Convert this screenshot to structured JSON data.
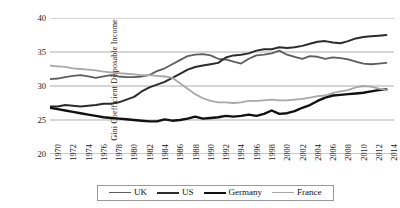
{
  "chart_data": {
    "type": "line",
    "title": "",
    "xlabel": "",
    "ylabel": "Gini Coefficient Disposable Income",
    "xlim": [
      1970,
      2015
    ],
    "ylim": [
      20,
      40
    ],
    "yticks": [
      40,
      35,
      30,
      25,
      20
    ],
    "grid": true,
    "legend_position": "bottom",
    "x": [
      1970,
      1971,
      1972,
      1973,
      1974,
      1975,
      1976,
      1977,
      1978,
      1979,
      1980,
      1981,
      1982,
      1983,
      1984,
      1985,
      1986,
      1987,
      1988,
      1989,
      1990,
      1991,
      1992,
      1993,
      1994,
      1995,
      1996,
      1997,
      1998,
      1999,
      2000,
      2001,
      2002,
      2003,
      2004,
      2005,
      2006,
      2007,
      2008,
      2009,
      2010,
      2011,
      2012,
      2013,
      2014
    ],
    "xticks": [
      "1970",
      "1972",
      "1974",
      "1976",
      "1978",
      "1980",
      "1982",
      "1984",
      "1986",
      "1988",
      "1990",
      "1992",
      "1994",
      "1996",
      "1998",
      "2000",
      "2002",
      "2004",
      "2006",
      "2008",
      "2010",
      "2012",
      "2014"
    ],
    "series": [
      {
        "name": "UK",
        "color": "#5e5e5e",
        "width": 1.8,
        "values": [
          31.0,
          31.1,
          31.3,
          31.5,
          31.6,
          31.4,
          31.2,
          31.4,
          31.6,
          31.4,
          31.3,
          31.3,
          31.4,
          31.6,
          32.2,
          32.6,
          33.2,
          33.8,
          34.4,
          34.6,
          34.7,
          34.5,
          34.0,
          33.9,
          33.6,
          33.3,
          34.0,
          34.5,
          34.6,
          34.8,
          35.2,
          34.6,
          34.3,
          34.0,
          34.4,
          34.3,
          34.0,
          34.2,
          34.1,
          33.9,
          33.6,
          33.3,
          33.2,
          33.3,
          33.4
        ]
      },
      {
        "name": "US",
        "color": "#2b2b2b",
        "width": 2.0,
        "values": [
          27.0,
          27.0,
          27.2,
          27.1,
          27.0,
          27.1,
          27.2,
          27.4,
          27.4,
          27.6,
          28.0,
          28.4,
          29.2,
          29.8,
          30.2,
          30.6,
          31.2,
          31.8,
          32.4,
          32.8,
          33.0,
          33.2,
          33.4,
          34.2,
          34.5,
          34.6,
          34.8,
          35.2,
          35.4,
          35.4,
          35.7,
          35.6,
          35.7,
          35.9,
          36.2,
          36.5,
          36.6,
          36.4,
          36.3,
          36.6,
          37.0,
          37.2,
          37.3,
          37.4,
          37.5
        ]
      },
      {
        "name": "Germany",
        "color": "#111111",
        "width": 2.4,
        "values": [
          26.8,
          26.6,
          26.4,
          26.2,
          26.0,
          25.8,
          25.6,
          25.4,
          25.3,
          25.2,
          25.1,
          25.0,
          24.9,
          24.8,
          24.8,
          25.1,
          24.9,
          25.0,
          25.2,
          25.5,
          25.2,
          25.3,
          25.4,
          25.6,
          25.5,
          25.6,
          25.8,
          25.6,
          25.9,
          26.4,
          25.9,
          26.0,
          26.3,
          26.8,
          27.2,
          27.8,
          28.3,
          28.6,
          28.7,
          28.8,
          28.9,
          29.0,
          29.2,
          29.4,
          29.5
        ]
      },
      {
        "name": "France",
        "color": "#a8a8a8",
        "width": 1.8,
        "values": [
          33.0,
          32.9,
          32.8,
          32.6,
          32.5,
          32.4,
          32.3,
          32.1,
          32.0,
          31.9,
          31.8,
          31.7,
          31.6,
          31.6,
          31.5,
          31.4,
          31.2,
          30.4,
          29.6,
          28.8,
          28.2,
          27.8,
          27.6,
          27.6,
          27.5,
          27.6,
          27.8,
          27.8,
          27.9,
          28.0,
          27.9,
          27.9,
          28.0,
          28.1,
          28.3,
          28.5,
          28.6,
          29.0,
          29.2,
          29.4,
          29.8,
          30.0,
          29.9,
          29.6,
          29.4
        ]
      }
    ]
  },
  "legend": {
    "items": [
      {
        "label": "UK"
      },
      {
        "label": "US"
      },
      {
        "label": "Germany"
      },
      {
        "label": "France"
      }
    ]
  }
}
